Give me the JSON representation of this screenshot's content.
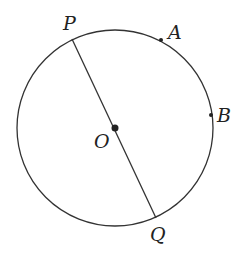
{
  "diagram": {
    "circle": {
      "cx": 115,
      "cy": 128,
      "r": 98
    },
    "center": {
      "name": "O",
      "x": 115,
      "y": 128,
      "label_x": 94,
      "label_y": 148
    },
    "points": [
      {
        "name": "P",
        "x": 72,
        "y": 39,
        "label_x": 63,
        "label_y": 30
      },
      {
        "name": "A",
        "x": 161,
        "y": 40,
        "label_x": 168,
        "label_y": 39
      },
      {
        "name": "B",
        "x": 211,
        "y": 115,
        "label_x": 217,
        "label_y": 122
      },
      {
        "name": "Q",
        "x": 156,
        "y": 218,
        "label_x": 150,
        "label_y": 241
      }
    ],
    "segments": [
      {
        "from": "P",
        "to": "Q"
      }
    ],
    "stroke_color": "#333333"
  }
}
